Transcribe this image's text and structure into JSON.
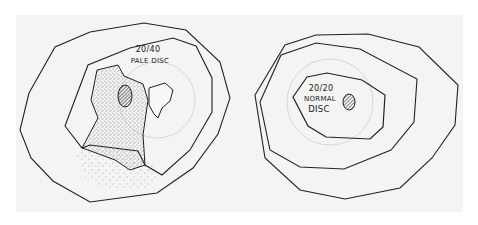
{
  "figure": {
    "panels": [
      {
        "id": "left",
        "acuity": "20/40",
        "disc": "PALE DISC",
        "description": "Visual field with dense stippled (shaded) defect region extending inferiorly, containing the blind spot; small unshaded island to the right"
      },
      {
        "id": "right",
        "acuity": "20/20",
        "disc_line1": "NORMAL",
        "disc_line2": "DISC",
        "description": "Normal visual field with three nested isopters and blind spot"
      }
    ]
  }
}
